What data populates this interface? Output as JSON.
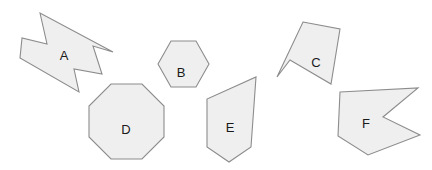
{
  "canvas": {
    "width": 432,
    "height": 170,
    "background_color": "#ffffff",
    "title": "Geometric shapes figure"
  },
  "style": {
    "shape_fill_color": "#efefef",
    "shape_stroke_color": "#8c8c8c",
    "label_color": "#1a1a1a",
    "stroke_width": 1.1,
    "label_font_size": 13
  },
  "shapes": [
    {
      "id": "shape-a",
      "label": "A",
      "kind": "concave-arrow-polygon",
      "sides": 8,
      "label_x": 64,
      "label_y": 55,
      "points": "40,13 47,44 22,38 20,58 79,92 74,69 102,74 93,46 113,52 40,13"
    },
    {
      "id": "shape-b",
      "label": "B",
      "kind": "hexagon",
      "sides": 6,
      "label_x": 181,
      "label_y": 72,
      "points": "171,41 196,41 209,64 196,87 171,87 158,64"
    },
    {
      "id": "shape-c",
      "label": "C",
      "kind": "concave-quadrilateral",
      "sides": 5,
      "label_x": 316,
      "label_y": 62,
      "points": "303,22 340,29 331,84 290,60 277,77"
    },
    {
      "id": "shape-d",
      "label": "D",
      "kind": "octagon",
      "sides": 8,
      "label_x": 126,
      "label_y": 129,
      "points": "111,84 142,84 164,106 164,137 142,159 111,159 89,137 89,106"
    },
    {
      "id": "shape-e",
      "label": "E",
      "kind": "pentagon",
      "sides": 5,
      "label_x": 230,
      "label_y": 127,
      "points": "256,77 251,147 229,162 207,147 207,99"
    },
    {
      "id": "shape-f",
      "label": "F",
      "kind": "concave-polygon",
      "sides": 6,
      "label_x": 366,
      "label_y": 123,
      "points": "340,92 418,88 383,117 420,135 368,155 338,136"
    }
  ]
}
